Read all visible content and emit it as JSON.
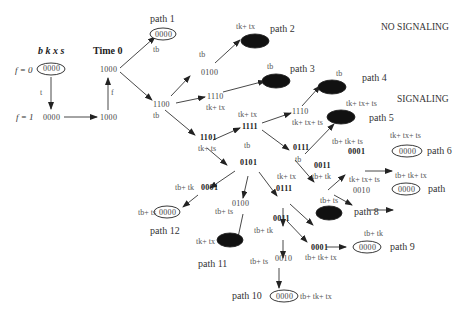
{
  "headers": {
    "columns": "b k x s",
    "time0": "Time 0",
    "no_signaling": "NO SIGNALING",
    "signaling": "SIGNALING",
    "f0": "f = 0",
    "f1": "f = 1"
  },
  "states": {
    "s0000_top": "0000",
    "s0000_f1": "0000",
    "s1000_bottom": "1000",
    "s1000_top": "1000",
    "s1100": "1100",
    "s0100": "0100",
    "s1110a": "1110",
    "s1101": "1101",
    "s1111": "1111",
    "s1110b": "1110",
    "s0111a": "0111",
    "s0101": "0101",
    "s0011a": "0011",
    "s0001a": "0001",
    "s0010a": "0010",
    "s0001b": "0001",
    "s0100b": "0100",
    "s0111b": "0111",
    "s0011b": "0011",
    "s0001c": "0001",
    "s0010b": "0010"
  },
  "edge_labels": {
    "t": "t",
    "f": "f",
    "tb1": "tb",
    "tb2": "tb",
    "tk_tx1": "tk+ tx",
    "tb3": "tb",
    "tk_tx2": "tk+ tx",
    "tb4": "tb",
    "tk_tx_ts1": "tk+ tx+ ts",
    "tk_tx3": "tk+ tx",
    "tk_ts": "tk+ ts",
    "tk_tx_ts2": "tk+ tx+ ts",
    "tb5": "tb",
    "tb_tk_ts1": "tb+ tk+ ts",
    "tb_tk1": "tb+ tk",
    "tk_tx_ts3": "tk+ tx+ ts",
    "tb_tk_tx1": "tb+ tk+ tx",
    "tb6": "tb",
    "tk_tx4": "tk+ tx",
    "tb_tk2": "tb+ tk",
    "tb_ts1": "tb+ ts",
    "tb_ts2": "tb+ ts",
    "tk_tx5": "tk+ tx",
    "tb_ts3": "tb+ ts",
    "tb_tk3": "tb+ tk",
    "tb_ts4": "tb+ ts",
    "tb_tk4": "tb+ tk",
    "tb_tk_tx2": "tb+ tk+ tx",
    "tb_ts5": "tb+ ts",
    "tb_tk_tx3": "tb+ tk+ tx"
  },
  "paths": {
    "p1": "path 1",
    "p2": "path 2",
    "p3": "path 3",
    "p4": "path 4",
    "p5": "path 5",
    "p6": "path 6",
    "p7": "path",
    "p8": "path 8",
    "p9": "path 9",
    "p10": "path 10",
    "p11": "path 11",
    "p12": "path 12"
  },
  "terminal_state": "0000",
  "colors": {
    "line": "#333333",
    "filled_node": "#111111"
  }
}
